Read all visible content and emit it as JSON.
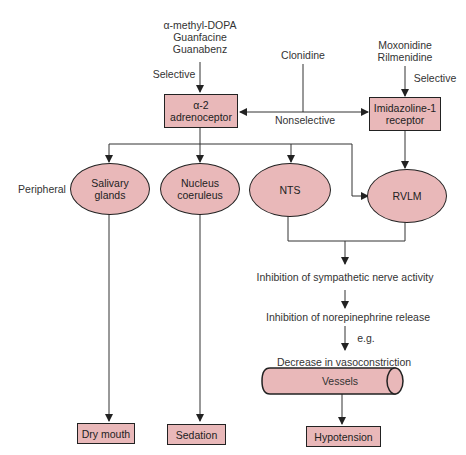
{
  "diagram": {
    "drugs": {
      "alpha2_selective": [
        "α-methyl-DOPA",
        "Guanfacine",
        "Guanabenz"
      ],
      "nonselective": "Clonidine",
      "imidazoline_selective": [
        "Moxonidine",
        "Rilmenidine"
      ]
    },
    "edge_labels": {
      "selective_left": "Selective",
      "selective_right": "Selective",
      "nonselective": "Nonselective",
      "peripheral": "Peripheral",
      "eg": "e.g."
    },
    "receptors": {
      "alpha2": [
        "α-2",
        "adrenoceptor"
      ],
      "imidazoline": [
        "Imidazoline-1",
        "receptor"
      ]
    },
    "sites": {
      "salivary": [
        "Salivary",
        "glands"
      ],
      "coeruleus": [
        "Nucleus",
        "coeruleus"
      ],
      "nts": "NTS",
      "rvlm": "RVLM"
    },
    "cascade": {
      "step1": "Inhibition of sympathetic nerve activity",
      "step2": "Inhibition of norepinephrine release",
      "step3": "Decrease in vasoconstriction",
      "vessels": "Vessels"
    },
    "outcomes": {
      "dry_mouth": "Dry mouth",
      "sedation": "Sedation",
      "hypotension": "Hypotension"
    },
    "colors": {
      "node_fill": "#e9b8b9",
      "stroke": "#222222",
      "text": "#333333"
    }
  }
}
